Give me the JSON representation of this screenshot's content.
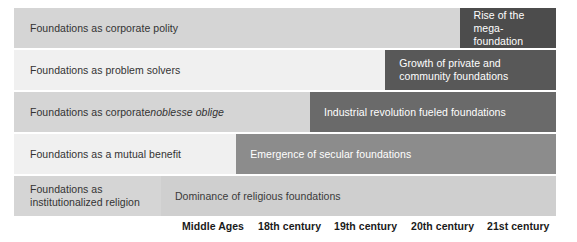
{
  "chart_data": {
    "type": "bar",
    "title": "",
    "subtitle": "",
    "xlabel": "",
    "ylabel": "",
    "orientation": "horizontal",
    "grid": false,
    "legend_position": "none",
    "categories": [
      "Foundations as corporate polity",
      "Foundations as problem solvers",
      "Foundations as corporate noblesse oblige",
      "Foundations as a mutual benefit",
      "Foundations as institutionalized religion"
    ],
    "x_tick_labels": [
      "Middle Ages",
      "18th century",
      "19th century",
      "20th century",
      "21st century"
    ],
    "series": [
      {
        "name": "Era of dominance",
        "values": [
          {
            "category": "Foundations as corporate polity",
            "label": "Rise of the\nmega-foundation",
            "start_era": "21st century",
            "end_era": "21st century",
            "start_pct": 82.2,
            "width_pct": 17.8,
            "fill": "#4c4c4c",
            "text_color": "#ffffff"
          },
          {
            "category": "Foundations as problem solvers",
            "label": "Growth of private and\ncommunity foundations",
            "start_era": "20th century",
            "end_era": "21st century",
            "start_pct": 68.5,
            "width_pct": 31.5,
            "fill": "#585858",
            "text_color": "#ffffff"
          },
          {
            "category": "Foundations as corporate noblesse oblige",
            "label": "Industrial revolution fueled foundations",
            "start_era": "19th century",
            "end_era": "21st century",
            "start_pct": 54.6,
            "width_pct": 45.4,
            "fill": "#6a6a6a",
            "text_color": "#ffffff"
          },
          {
            "category": "Foundations as a mutual benefit",
            "label": "Emergence of secular foundations",
            "start_era": "18th century",
            "end_era": "21st century",
            "start_pct": 41.0,
            "width_pct": 59.0,
            "fill": "#8c8c8c",
            "text_color": "#ffffff"
          },
          {
            "category": "Foundations as institutionalized religion",
            "label": "Dominance of religious foundations",
            "start_era": "Middle Ages",
            "end_era": "21st century",
            "start_pct": 27.1,
            "width_pct": 72.9,
            "fill": "#cfcfcf",
            "text_color": "#3a3a3a"
          }
        ]
      }
    ],
    "rows": [
      {
        "label": "Foundations as corporate polity",
        "label_italic_part": "",
        "base_fill": "#d5d5d5",
        "label_width_pct": 82.2
      },
      {
        "label": "Foundations as problem solvers",
        "label_italic_part": "",
        "base_fill": "#f0f0f0",
        "label_width_pct": 68.5
      },
      {
        "label": "Foundations as corporate ",
        "label_italic_part": "noblesse oblige",
        "base_fill": "#d5d5d5",
        "label_width_pct": 54.6
      },
      {
        "label": "Foundations as a mutual benefit",
        "label_italic_part": "",
        "base_fill": "#f0f0f0",
        "label_width_pct": 41.0
      },
      {
        "label": "Foundations as\ninstitutionalized religion",
        "label_italic_part": "",
        "base_fill": "#d5d5d5",
        "label_width_pct": 27.1
      }
    ]
  },
  "axis": {
    "ticks": [
      {
        "label": "Middle Ages",
        "left_px": 182
      },
      {
        "label": "18th century",
        "left_px": 258
      },
      {
        "label": "19th century",
        "left_px": 334
      },
      {
        "label": "20th century",
        "left_px": 411
      },
      {
        "label": "21st century",
        "left_px": 487
      }
    ]
  }
}
